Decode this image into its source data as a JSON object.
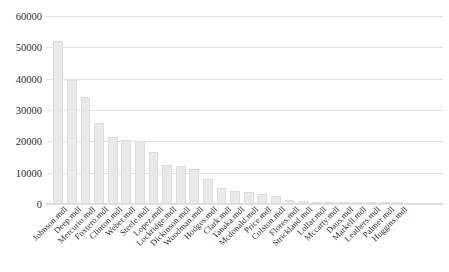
{
  "chart_data": {
    "type": "bar",
    "title": "",
    "xlabel": "",
    "ylabel": "",
    "ylim": [
      0,
      60000
    ],
    "ytick_labels": [
      "60000",
      "50000",
      "40000",
      "30000",
      "20000",
      "10000",
      "0"
    ],
    "yticks": [
      60000,
      50000,
      40000,
      30000,
      20000,
      10000,
      0
    ],
    "grid": true,
    "legend": "none",
    "orientation": "vertical",
    "bar_color": "#e9e9e9",
    "bar_edge_color": "#dcdcdc",
    "gridline_color": "#e2e2e2",
    "categories": [
      "Johnson.mdl",
      "Deep.mdl",
      "Mercurio.mdl",
      "Foxtero.mdl",
      "Clinton.mdl",
      "Weber.mdl",
      "Steele.mdl",
      "Lopez.mdl",
      "Lockridge.mdl",
      "Dickinson.mdl",
      "Woodman.mdl",
      "Hodges.mdl",
      "Clark.mdl",
      "Tanaka.mdl",
      "Mcdonald.mdl",
      "Price.mdl",
      "Colston.mdl",
      "Flores.mdl",
      "Strickland.mdl",
      "Lollar.mdl",
      "Mccarty.mdl",
      "Daus.mdl",
      "Markell.mdl",
      "Leathers.mdl",
      "Palmer.mdl",
      "Huggins.mdl"
    ],
    "values": [
      52000,
      39500,
      34000,
      25800,
      21500,
      20300,
      20200,
      16500,
      12400,
      12200,
      11300,
      8000,
      5200,
      4300,
      3900,
      3100,
      2700,
      1400,
      900,
      700,
      600,
      500,
      420,
      360,
      300,
      250
    ]
  }
}
